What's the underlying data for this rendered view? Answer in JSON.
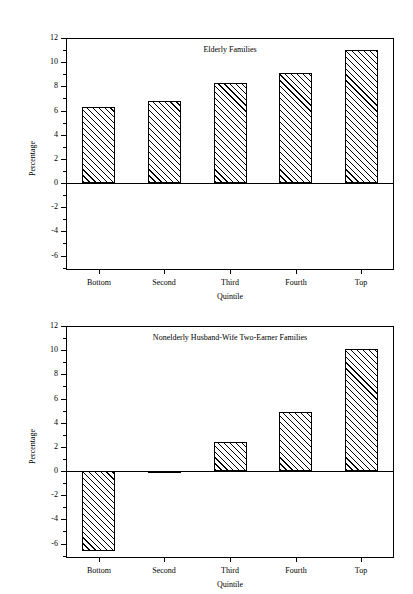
{
  "figure": {
    "background_color": "#ffffff",
    "ink_color": "#000000"
  },
  "chart_data": [
    {
      "type": "bar",
      "title": "Elderly Families",
      "categories": [
        "Bottom",
        "Second",
        "Third",
        "Fourth",
        "Top"
      ],
      "values": [
        6.3,
        6.8,
        8.3,
        9.1,
        11.0
      ],
      "xlabel": "Quintile",
      "ylabel": "Percentage",
      "ylim": [
        -7.2,
        12
      ],
      "ytick_labels": [
        "12",
        "10",
        "8",
        "6",
        "4",
        "2",
        "0",
        "-2",
        "-4",
        "-6"
      ],
      "ytick_values": [
        12,
        10,
        8,
        6,
        4,
        2,
        0,
        -2,
        -4,
        -6
      ],
      "yminor_values": [
        11,
        9,
        7,
        5,
        3,
        1,
        -1,
        -3,
        -5,
        -7
      ],
      "grid": false,
      "legend": "none",
      "bar_style": "diagonal-hatch-45",
      "zero_line": true
    },
    {
      "type": "bar",
      "title": "Nonelderly Husband-Wife Two-Earner Families",
      "categories": [
        "Bottom",
        "Second",
        "Third",
        "Fourth",
        "Top"
      ],
      "values": [
        -6.6,
        -0.15,
        2.4,
        4.9,
        10.1
      ],
      "xlabel": "Quintile",
      "ylabel": "Percentage",
      "ylim": [
        -7.2,
        12
      ],
      "ytick_labels": [
        "12",
        "10",
        "8",
        "6",
        "4",
        "2",
        "0",
        "-2",
        "-4",
        "-6"
      ],
      "ytick_values": [
        12,
        10,
        8,
        6,
        4,
        2,
        0,
        -2,
        -4,
        -6
      ],
      "yminor_values": [
        11,
        9,
        7,
        5,
        3,
        1,
        -1,
        -3,
        -5,
        -7
      ],
      "grid": false,
      "legend": "none",
      "bar_style": "diagonal-hatch-45",
      "zero_line": true
    }
  ]
}
